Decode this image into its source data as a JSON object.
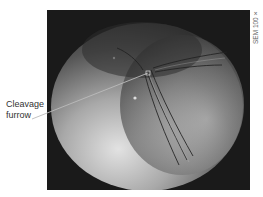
{
  "figure": {
    "image_type": "scanning electron micrograph",
    "scale_label": "SEM 100×",
    "callout": {
      "line1": "Cleavage",
      "line2": "furrow"
    },
    "colors": {
      "background": "#1a1a1a",
      "specimen_light": "#d8d8d8",
      "specimen_dark": "#3a3a3a",
      "pointer_line": "#bbbbbb"
    }
  }
}
